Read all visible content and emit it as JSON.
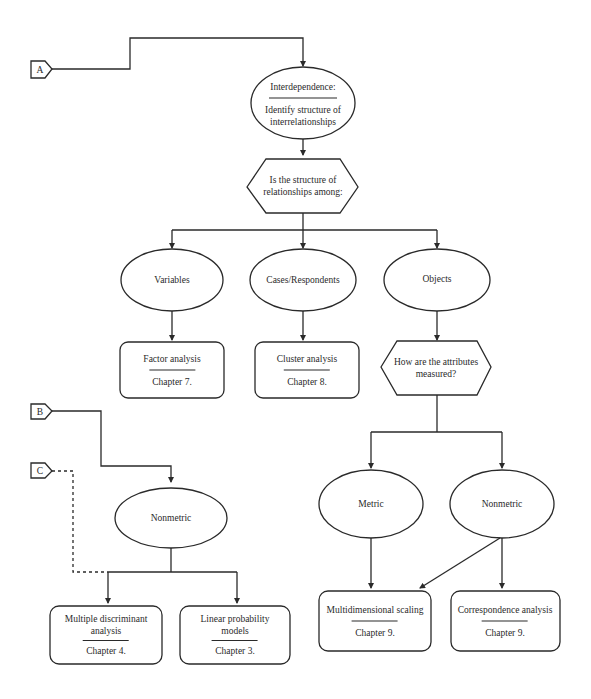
{
  "connectors": {
    "A": "A",
    "B": "B",
    "C": "C"
  },
  "nodes": {
    "interdependence": {
      "title": "Interdependence:",
      "subtitle_line1": "Identify structure of",
      "subtitle_line2": "interrelationships"
    },
    "question_structure": {
      "line1": "Is the structure of",
      "line2": "relationships among:"
    },
    "variables": {
      "label": "Variables"
    },
    "cases": {
      "label": "Cases/Respondents"
    },
    "objects": {
      "label": "Objects"
    },
    "factor_analysis": {
      "title": "Factor analysis",
      "chapter": "Chapter 7."
    },
    "cluster_analysis": {
      "title": "Cluster analysis",
      "chapter": "Chapter 8."
    },
    "question_measured": {
      "line1": "How are the attributes",
      "line2": "measured?"
    },
    "metric": {
      "label": "Metric"
    },
    "nonmetric_right": {
      "label": "Nonmetric"
    },
    "mds": {
      "title": "Multidimensional scaling",
      "chapter": "Chapter 9."
    },
    "correspondence": {
      "title": "Correspondence analysis",
      "chapter": "Chapter 9."
    },
    "nonmetric_left": {
      "label": "Nonmetric"
    },
    "mda": {
      "title_line1": "Multiple discriminant",
      "title_line2": "analysis",
      "chapter": "Chapter 4."
    },
    "lpm": {
      "title_line1": "Linear probability",
      "title_line2": "models",
      "chapter": "Chapter 3."
    }
  }
}
